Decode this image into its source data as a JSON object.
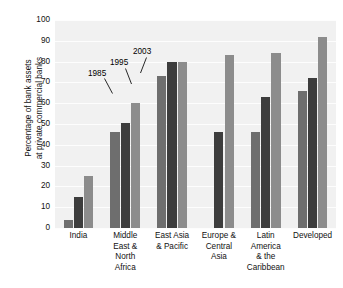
{
  "chart_data": {
    "type": "bar",
    "title": "",
    "xlabel": "",
    "ylabel": "Percentage of bank assets at private commercial banks",
    "ylabel_lines": [
      "Percentage of bank assets",
      "at private commercial banks"
    ],
    "ylim": [
      0,
      100
    ],
    "ytick_labels": [
      "100",
      "90",
      "80",
      "70",
      "60",
      "50",
      "40",
      "30",
      "20",
      "10",
      "0"
    ],
    "ytick_values": [
      100,
      90,
      80,
      70,
      60,
      50,
      40,
      30,
      20,
      10,
      0
    ],
    "grid": true,
    "legend_position": "none",
    "categories": [
      "India",
      "Middle East & North Africa",
      "East Asia & Pacific",
      "Europe & Central Asia",
      "Latin America & the Caribbean",
      "Developed"
    ],
    "category_label_lines": [
      [
        "India"
      ],
      [
        "Middle",
        "East &",
        "North",
        "Africa"
      ],
      [
        "East Asia",
        "& Pacific"
      ],
      [
        "Europe &",
        "Central",
        "Asia"
      ],
      [
        "Latin",
        "America",
        "& the",
        "Caribbean"
      ],
      [
        "Developed"
      ]
    ],
    "series": [
      {
        "name": "1985",
        "color": "#6e6e6e",
        "values": [
          4,
          46,
          73,
          null,
          46,
          66
        ]
      },
      {
        "name": "1995",
        "color": "#3d3d3d",
        "values": [
          15,
          50.5,
          80,
          46,
          63,
          72
        ]
      },
      {
        "name": "2003",
        "color": "#8c8c8c",
        "values": [
          25,
          60,
          80,
          83,
          84,
          92
        ]
      }
    ],
    "annotations": [
      {
        "text": "1985",
        "target_series": "1985",
        "target_category": "Middle East & North Africa"
      },
      {
        "text": "1995",
        "target_series": "1995",
        "target_category": "Middle East & North Africa"
      },
      {
        "text": "2003",
        "target_series": "2003",
        "target_category": "Middle East & North Africa"
      }
    ],
    "colors": {
      "plot_background": "#f1f1f1",
      "gridline": "#fdfdfd",
      "page_background": "#ffffff",
      "text": "#111111"
    }
  }
}
